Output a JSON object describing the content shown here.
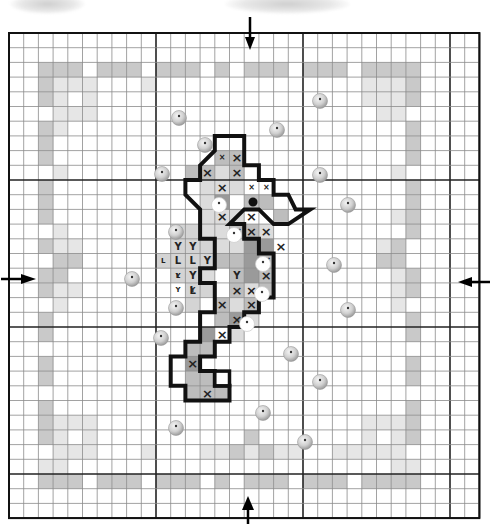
{
  "pattern": {
    "title": "Seahorse cross-stitch chart",
    "grid": {
      "origin_x": 9,
      "origin_y": 33,
      "cell": 14.7,
      "cols": 32,
      "rows": 33,
      "major_every": 10,
      "minor_color": "#8a8a8a",
      "major_color": "#222222",
      "frame_color": "#111111"
    },
    "colors": {
      "border_dark": "#c9c9c9",
      "border_light": "#e6e6e6",
      "body_mid": "#bdbdbd",
      "body_dark": "#9a9a9a",
      "body_light": "#dcdcdc",
      "fin_light": "#d4d4d4",
      "outline": "#111111",
      "bead_fill": "#d0d0d0",
      "bead_white": "#ffffff"
    },
    "center_arrows": [
      {
        "name": "arrow-top",
        "dir": "down",
        "x": 250,
        "y": 37
      },
      {
        "name": "arrow-bottom",
        "dir": "up",
        "x": 248,
        "y": 524
      },
      {
        "name": "arrow-left",
        "dir": "right",
        "x": 11,
        "y": 279
      },
      {
        "name": "arrow-right",
        "dir": "left",
        "x": 482,
        "y": 282
      }
    ],
    "border_dark_cells": [
      [
        2,
        2
      ],
      [
        3,
        2
      ],
      [
        4,
        2
      ],
      [
        6,
        2
      ],
      [
        7,
        2
      ],
      [
        8,
        2
      ],
      [
        10,
        2
      ],
      [
        11,
        2
      ],
      [
        12,
        2
      ],
      [
        14,
        2
      ],
      [
        16,
        2
      ],
      [
        17,
        2
      ],
      [
        18,
        2
      ],
      [
        20,
        2
      ],
      [
        21,
        2
      ],
      [
        22,
        2
      ],
      [
        24,
        2
      ],
      [
        25,
        2
      ],
      [
        26,
        2
      ],
      [
        27,
        2
      ],
      [
        2,
        3
      ],
      [
        2,
        4
      ],
      [
        2,
        6
      ],
      [
        2,
        7
      ],
      [
        2,
        8
      ],
      [
        2,
        10
      ],
      [
        2,
        11
      ],
      [
        2,
        12
      ],
      [
        2,
        14
      ],
      [
        2,
        16
      ],
      [
        2,
        17
      ],
      [
        2,
        19
      ],
      [
        2,
        20
      ],
      [
        2,
        22
      ],
      [
        2,
        23
      ],
      [
        2,
        25
      ],
      [
        2,
        26
      ],
      [
        2,
        27
      ],
      [
        27,
        3
      ],
      [
        27,
        4
      ],
      [
        27,
        6
      ],
      [
        27,
        7
      ],
      [
        27,
        8
      ],
      [
        27,
        10
      ],
      [
        27,
        11
      ],
      [
        27,
        12
      ],
      [
        27,
        13
      ],
      [
        27,
        16
      ],
      [
        27,
        17
      ],
      [
        27,
        19
      ],
      [
        27,
        20
      ],
      [
        27,
        22
      ],
      [
        27,
        23
      ],
      [
        27,
        25
      ],
      [
        27,
        26
      ],
      [
        27,
        27
      ],
      [
        2,
        30
      ],
      [
        3,
        30
      ],
      [
        4,
        30
      ],
      [
        6,
        30
      ],
      [
        7,
        30
      ],
      [
        8,
        30
      ],
      [
        10,
        30
      ],
      [
        11,
        30
      ],
      [
        12,
        30
      ],
      [
        14,
        30
      ],
      [
        16,
        30
      ],
      [
        17,
        30
      ],
      [
        18,
        30
      ],
      [
        20,
        30
      ],
      [
        21,
        30
      ],
      [
        22,
        30
      ],
      [
        24,
        30
      ],
      [
        25,
        30
      ],
      [
        26,
        30
      ],
      [
        27,
        30
      ],
      [
        16,
        27
      ],
      [
        15,
        28
      ],
      [
        17,
        28
      ],
      [
        26,
        14
      ],
      [
        26,
        15
      ],
      [
        25,
        15
      ],
      [
        3,
        15
      ],
      [
        4,
        15
      ],
      [
        3,
        16
      ]
    ],
    "border_light_cells": [
      [
        3,
        3
      ],
      [
        4,
        3
      ],
      [
        5,
        3
      ],
      [
        9,
        3
      ],
      [
        3,
        4
      ],
      [
        5,
        4
      ],
      [
        3,
        5
      ],
      [
        4,
        5
      ],
      [
        5,
        5
      ],
      [
        26,
        3
      ],
      [
        25,
        3
      ],
      [
        24,
        4
      ],
      [
        25,
        4
      ],
      [
        26,
        4
      ],
      [
        25,
        5
      ],
      [
        26,
        5
      ],
      [
        24,
        3
      ],
      [
        3,
        6
      ],
      [
        3,
        9
      ],
      [
        3,
        13
      ],
      [
        3,
        14
      ],
      [
        4,
        14
      ],
      [
        3,
        17
      ],
      [
        4,
        17
      ],
      [
        3,
        18
      ],
      [
        26,
        9
      ],
      [
        26,
        12
      ],
      [
        26,
        16
      ],
      [
        26,
        18
      ],
      [
        25,
        14
      ],
      [
        26,
        17
      ],
      [
        3,
        26
      ],
      [
        4,
        26
      ],
      [
        5,
        26
      ],
      [
        3,
        27
      ],
      [
        5,
        27
      ],
      [
        3,
        28
      ],
      [
        4,
        28
      ],
      [
        5,
        28
      ],
      [
        24,
        26
      ],
      [
        25,
        26
      ],
      [
        26,
        26
      ],
      [
        24,
        27
      ],
      [
        26,
        27
      ],
      [
        24,
        28
      ],
      [
        25,
        28
      ],
      [
        26,
        28
      ],
      [
        9,
        28
      ],
      [
        19,
        28
      ],
      [
        13,
        28
      ],
      [
        14,
        28
      ],
      [
        16,
        28
      ],
      [
        18,
        28
      ],
      [
        22,
        28
      ],
      [
        23,
        28
      ],
      [
        3,
        29
      ],
      [
        26,
        29
      ],
      [
        2,
        29
      ],
      [
        27,
        29
      ]
    ],
    "seahorse": {
      "light_cells": [
        [
          14,
          9
        ],
        [
          15,
          10
        ],
        [
          13,
          10
        ],
        [
          14,
          10
        ],
        [
          14,
          11
        ],
        [
          13,
          11
        ],
        [
          15,
          12
        ],
        [
          14,
          12
        ],
        [
          13,
          12
        ],
        [
          13,
          13
        ],
        [
          14,
          13
        ],
        [
          14,
          14
        ],
        [
          15,
          14
        ],
        [
          17,
          14
        ],
        [
          16,
          15
        ],
        [
          13,
          16
        ],
        [
          16,
          17
        ],
        [
          15,
          18
        ],
        [
          16,
          19
        ],
        [
          15,
          20
        ],
        [
          17,
          13
        ]
      ],
      "mid_cells": [
        [
          14,
          8
        ],
        [
          15,
          8
        ],
        [
          12,
          9
        ],
        [
          13,
          9
        ],
        [
          15,
          9
        ],
        [
          16,
          11
        ],
        [
          17,
          11
        ],
        [
          18,
          12
        ],
        [
          15,
          13
        ],
        [
          15,
          15
        ],
        [
          15,
          16
        ],
        [
          16,
          16
        ],
        [
          14,
          15
        ],
        [
          16,
          13
        ],
        [
          17,
          15
        ],
        [
          17,
          16
        ],
        [
          17,
          17
        ],
        [
          15,
          17
        ],
        [
          14,
          18
        ],
        [
          16,
          18
        ],
        [
          14,
          19
        ],
        [
          13,
          20
        ],
        [
          12,
          21
        ],
        [
          13,
          21
        ],
        [
          12,
          22
        ],
        [
          12,
          23
        ],
        [
          13,
          23
        ],
        [
          12,
          24
        ],
        [
          13,
          24
        ],
        [
          14,
          24
        ]
      ],
      "dark_cells": [
        [
          14,
          11
        ],
        [
          16,
          14
        ],
        [
          17,
          14
        ],
        [
          16,
          15
        ],
        [
          16,
          16
        ],
        [
          15,
          19
        ],
        [
          13,
          20
        ],
        [
          12,
          22
        ]
      ],
      "fin_cells": [
        [
          11,
          13
        ],
        [
          12,
          13
        ],
        [
          11,
          14
        ],
        [
          12,
          14
        ],
        [
          13,
          14
        ],
        [
          11,
          15
        ],
        [
          12,
          15
        ],
        [
          13,
          15
        ],
        [
          12,
          16
        ],
        [
          12,
          17
        ],
        [
          13,
          17
        ],
        [
          10,
          15
        ],
        [
          11,
          16
        ],
        [
          12,
          18
        ]
      ],
      "x_marks": [
        [
          15,
          8
        ],
        [
          13,
          9
        ],
        [
          15,
          9
        ],
        [
          14,
          10
        ],
        [
          14,
          12
        ],
        [
          16,
          12
        ],
        [
          15,
          13
        ],
        [
          16,
          13
        ],
        [
          17,
          13
        ],
        [
          18,
          14
        ],
        [
          17,
          15
        ],
        [
          17,
          16
        ],
        [
          15,
          17
        ],
        [
          16,
          17
        ],
        [
          14,
          18
        ],
        [
          16,
          18
        ],
        [
          15,
          19
        ],
        [
          14,
          20
        ],
        [
          12,
          22
        ],
        [
          13,
          24
        ]
      ],
      "small_x_marks": [
        [
          14,
          8
        ],
        [
          16,
          10
        ],
        [
          17,
          10
        ]
      ],
      "y_marks": [
        [
          11,
          13
        ],
        [
          11,
          14
        ],
        [
          12,
          14
        ],
        [
          13,
          15
        ],
        [
          12,
          16
        ],
        [
          15,
          16
        ]
      ],
      "small_y_marks": [
        [
          11,
          16
        ],
        [
          12,
          17
        ],
        [
          11,
          17
        ]
      ],
      "l_marks": [
        [
          11,
          15
        ],
        [
          12,
          15
        ],
        [
          12,
          17
        ]
      ],
      "small_l_marks": [
        [
          10,
          15
        ],
        [
          11,
          16
        ]
      ],
      "eye": {
        "col": 16.6,
        "row": 11.5,
        "r": 4.5
      },
      "outline_path": "M 13 9 L 14 8 L 14 7 L 16 7 L 16 9 L 17 9 L 17 10 L 18 10 L 18 11 L 19 11 L 19.5 12 L 20.5 12 L 19 13 L 18 13 L 17 12 L 16 12 L 15 13 L 16 13 L 16 14 L 17 14 L 17 15 L 18 15 L 18 18 L 17 18 L 17 19 L 16 19 L 16 20 L 15 20 L 15 21 L 14 21 L 14 22 L 13 22 L 13 23 L 14 23 L 14 24 L 15 24 L 15 25 L 12 25 L 12 24 L 11 24 L 11 22 L 12 22 L 12 21 L 13 21 L 13 19 L 14 19 L 14 17 L 13 17 L 13 16 L 14 16 L 14 14 L 13 14 L 13 12 L 12 11 L 12 10 L 13 10 Z",
      "tail_loop": {
        "col": 14,
        "row": 23,
        "w": 1,
        "h": 1
      }
    },
    "beads": [
      {
        "cx": 179,
        "cy": 118,
        "type": "grey"
      },
      {
        "cx": 320,
        "cy": 101,
        "type": "grey"
      },
      {
        "cx": 205,
        "cy": 145,
        "type": "grey"
      },
      {
        "cx": 277,
        "cy": 130,
        "type": "grey"
      },
      {
        "cx": 162,
        "cy": 174,
        "type": "grey"
      },
      {
        "cx": 320,
        "cy": 175,
        "type": "grey"
      },
      {
        "cx": 219,
        "cy": 205,
        "type": "white"
      },
      {
        "cx": 348,
        "cy": 205,
        "type": "grey"
      },
      {
        "cx": 176,
        "cy": 232,
        "type": "grey"
      },
      {
        "cx": 234,
        "cy": 235,
        "type": "white"
      },
      {
        "cx": 334,
        "cy": 265,
        "type": "grey"
      },
      {
        "cx": 263,
        "cy": 264,
        "type": "white"
      },
      {
        "cx": 132,
        "cy": 279,
        "type": "grey"
      },
      {
        "cx": 176,
        "cy": 308,
        "type": "grey"
      },
      {
        "cx": 262,
        "cy": 294,
        "type": "white"
      },
      {
        "cx": 348,
        "cy": 310,
        "type": "grey"
      },
      {
        "cx": 247,
        "cy": 324,
        "type": "white"
      },
      {
        "cx": 161,
        "cy": 338,
        "type": "grey"
      },
      {
        "cx": 291,
        "cy": 354,
        "type": "grey"
      },
      {
        "cx": 320,
        "cy": 382,
        "type": "grey"
      },
      {
        "cx": 263,
        "cy": 413,
        "type": "grey"
      },
      {
        "cx": 176,
        "cy": 428,
        "type": "grey"
      },
      {
        "cx": 305,
        "cy": 442,
        "type": "grey"
      }
    ]
  },
  "symbols": {
    "x": "×",
    "y": "Y",
    "l": "L"
  }
}
